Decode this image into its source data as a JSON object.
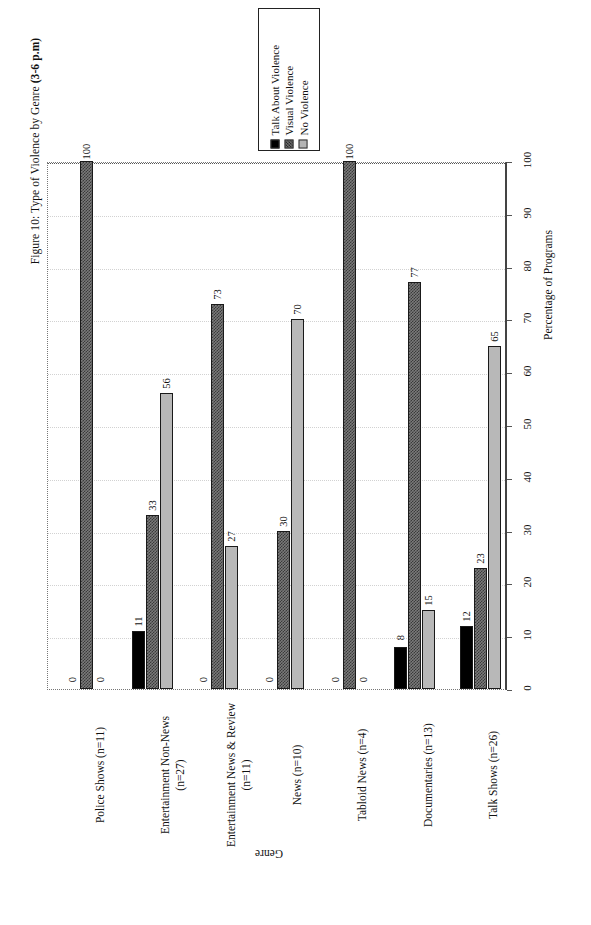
{
  "figure": {
    "caption_prefix": "Figure 10: Type of Violence by Genre ",
    "caption_bold": "(3-6 p.m)"
  },
  "legend": {
    "items": [
      {
        "label": "Talk About Violence",
        "color": "#000000",
        "swatch": "sw-talk"
      },
      {
        "label": "Visual Violence",
        "color": "#555555",
        "swatch": "sw-visual"
      },
      {
        "label": "No Violence",
        "color": "#b4b4b4",
        "swatch": "sw-none"
      }
    ]
  },
  "axes": {
    "value_axis_title": "Percentage of Programs",
    "category_axis_title": "Genre",
    "ticks": [
      "0",
      "10",
      "20",
      "30",
      "40",
      "50",
      "60",
      "70",
      "80",
      "90",
      "100"
    ]
  },
  "chart_data": {
    "type": "bar",
    "title": "Figure 10: Type of Violence by Genre (3-6 p.m)",
    "xlabel": "Genre",
    "ylabel": "Percentage of Programs",
    "ylim": [
      0,
      100
    ],
    "grid": true,
    "orientation": "horizontal-rotated",
    "legend_position": "top-center",
    "categories": [
      "Police Shows (n=11)",
      "Entertainment Non-News (n=27)",
      "Entertainment News & Review (n=11)",
      "News (n=10)",
      "Tabloid News (n=4)",
      "Documentaries (n=13)",
      "Talk Shows (n=26)"
    ],
    "category_lines": [
      [
        "Police Shows (n=11)"
      ],
      [
        "Entertainment Non-News",
        "(n=27)"
      ],
      [
        "Entertainment News & Review",
        "(n=11)"
      ],
      [
        "News (n=10)"
      ],
      [
        "Tabloid News (n=4)"
      ],
      [
        "Documentaries (n=13)"
      ],
      [
        "Talk Shows (n=26)"
      ]
    ],
    "series": [
      {
        "name": "Talk About Violence",
        "values": [
          0,
          11,
          0,
          0,
          0,
          8,
          12
        ]
      },
      {
        "name": "Visual Violence",
        "values": [
          100,
          33,
          73,
          30,
          100,
          77,
          23
        ]
      },
      {
        "name": "No Violence",
        "values": [
          0,
          56,
          27,
          70,
          0,
          15,
          65
        ]
      }
    ]
  }
}
